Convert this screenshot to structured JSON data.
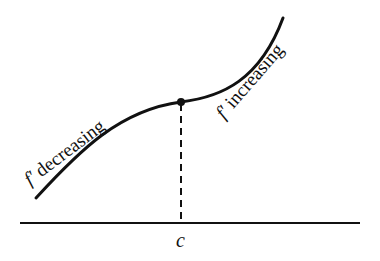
{
  "diagram": {
    "type": "inflection-point-illustration",
    "axis": {
      "point_label": "c"
    },
    "labels": {
      "left_segment": {
        "prime_symbol": "f′",
        "text": " decreasing"
      },
      "right_segment": {
        "prime_symbol": "f′",
        "text": " increasing"
      }
    },
    "inflection_point": {
      "marker": "filled-dot",
      "connector": "dashed-vertical-line"
    },
    "colors": {
      "stroke": "#111111",
      "background": "#ffffff"
    }
  }
}
